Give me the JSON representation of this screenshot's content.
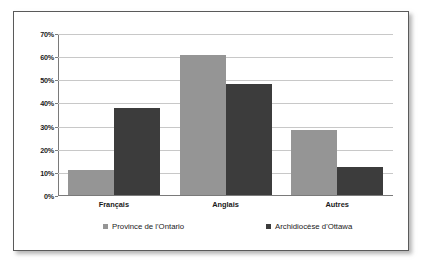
{
  "chart_data": {
    "type": "bar",
    "title": "",
    "xlabel": "",
    "ylabel": "",
    "categories": [
      "Français",
      "Anglais",
      "Autres"
    ],
    "series": [
      {
        "name": "Province de l'Ontario",
        "color": "#959595",
        "values": [
          11,
          60.5,
          28
        ]
      },
      {
        "name": "Archidiocèse d'Ottawa",
        "color": "#3c3c3c",
        "values": [
          37.5,
          48,
          12
        ]
      }
    ],
    "ylim": [
      0,
      70
    ],
    "yticks": [
      0,
      10,
      20,
      30,
      40,
      50,
      60,
      70
    ],
    "ytick_labels": [
      "0%",
      "10%",
      "20%",
      "30%",
      "40%",
      "50%",
      "60%",
      "70%"
    ],
    "grid": true,
    "legend_position": "bottom"
  },
  "frame": {
    "border_color": "#5a5a5a",
    "background": "#ffffff"
  }
}
